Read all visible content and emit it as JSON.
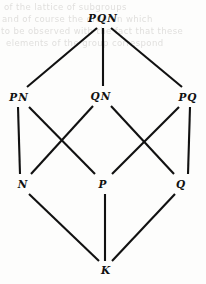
{
  "figure": {
    "type": "hasse-diagram",
    "background_color": "#fdfdfc",
    "line_color": "#111111",
    "label_color": "#111111"
  },
  "ghost_text": {
    "description": "faint bleed-through text from reverse of scanned page",
    "color": "#c9c7c4",
    "lines": [
      "of  the  lattice  of  subgroups",
      "and  of  course  the  order  in  which",
      "to  be  observed  with  the  fact  that  these",
      "elements  of  the  group  correspond"
    ]
  },
  "chart_data": {
    "type": "diagram",
    "title": "",
    "nodes": [
      {
        "id": "PQN",
        "label": "PQN",
        "x": 103,
        "y": 18,
        "level": 0
      },
      {
        "id": "PN",
        "label": "PN",
        "x": 19,
        "y": 97,
        "level": 1
      },
      {
        "id": "QN",
        "label": "QN",
        "x": 101,
        "y": 96,
        "level": 1
      },
      {
        "id": "PQ",
        "label": "PQ",
        "x": 188,
        "y": 97,
        "level": 1
      },
      {
        "id": "N",
        "label": "N",
        "x": 23,
        "y": 184,
        "level": 2
      },
      {
        "id": "P",
        "label": "P",
        "x": 103,
        "y": 184,
        "level": 2
      },
      {
        "id": "Q",
        "label": "Q",
        "x": 181,
        "y": 184,
        "level": 2
      },
      {
        "id": "K",
        "label": "K",
        "x": 106,
        "y": 270,
        "level": 3
      }
    ],
    "edges": [
      {
        "from": "PQN",
        "to": "PN",
        "x1": 97,
        "y1": 28,
        "x2": 27,
        "y2": 87
      },
      {
        "from": "PQN",
        "to": "QN",
        "x1": 103,
        "y1": 28,
        "x2": 103,
        "y2": 86
      },
      {
        "from": "PQN",
        "to": "PQ",
        "x1": 111,
        "y1": 28,
        "x2": 182,
        "y2": 87
      },
      {
        "from": "PN",
        "to": "N",
        "x1": 18,
        "y1": 107,
        "x2": 20,
        "y2": 174
      },
      {
        "from": "PN",
        "to": "P",
        "x1": 29,
        "y1": 107,
        "x2": 95,
        "y2": 174
      },
      {
        "from": "QN",
        "to": "N",
        "x1": 93,
        "y1": 106,
        "x2": 31,
        "y2": 174
      },
      {
        "from": "QN",
        "to": "Q",
        "x1": 111,
        "y1": 106,
        "x2": 174,
        "y2": 174
      },
      {
        "from": "PQ",
        "to": "P",
        "x1": 179,
        "y1": 107,
        "x2": 112,
        "y2": 174
      },
      {
        "from": "PQ",
        "to": "Q",
        "x1": 190,
        "y1": 107,
        "x2": 188,
        "y2": 174
      },
      {
        "from": "N",
        "to": "K",
        "x1": 29,
        "y1": 194,
        "x2": 99,
        "y2": 261
      },
      {
        "from": "P",
        "to": "K",
        "x1": 105,
        "y1": 194,
        "x2": 105,
        "y2": 261
      },
      {
        "from": "Q",
        "to": "K",
        "x1": 175,
        "y1": 194,
        "x2": 112,
        "y2": 261
      }
    ],
    "xlabel": "",
    "ylabel": "",
    "legend": []
  }
}
